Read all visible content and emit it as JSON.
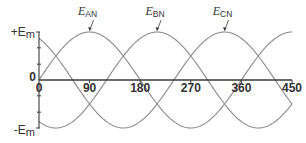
{
  "chart_data": {
    "type": "line",
    "title": "",
    "xlabel": "",
    "ylabel": "",
    "x_unit": "degrees",
    "xlim": [
      0,
      450
    ],
    "ylim": [
      -1,
      1
    ],
    "grid": false,
    "legend": "inline-annotations",
    "x_ticks": [
      0,
      90,
      180,
      270,
      360,
      450
    ],
    "x_tick_labels": [
      "0",
      "90",
      "180",
      "270",
      "360",
      "450"
    ],
    "y_ticks": [
      {
        "value": 1,
        "label_prefix": "+E",
        "label_sub": "m"
      },
      {
        "value": 0,
        "label_prefix": "0",
        "label_sub": ""
      },
      {
        "value": -1,
        "label_prefix": "-E",
        "label_sub": "m"
      }
    ],
    "y_minor_ticks": [
      0.67,
      0.33,
      -0.33,
      -0.67
    ],
    "series": [
      {
        "name": "E_AN",
        "label_main": "E",
        "label_sub": "AN",
        "function": "sin(θ)",
        "phase_deg": 0,
        "peak_at_deg": 90,
        "color": "#8a8a8a",
        "x": [
          0,
          30,
          60,
          90,
          120,
          150,
          180,
          210,
          240,
          270,
          300,
          330,
          360,
          390,
          420,
          450
        ],
        "values": [
          0,
          0.5,
          0.866,
          1,
          0.866,
          0.5,
          0,
          -0.5,
          -0.866,
          -1,
          -0.866,
          -0.5,
          0,
          0.5,
          0.866,
          1
        ]
      },
      {
        "name": "E_BN",
        "label_main": "E",
        "label_sub": "BN",
        "function": "sin(θ-120°)",
        "phase_deg": -120,
        "peak_at_deg": 210,
        "color": "#8a8a8a",
        "x": [
          0,
          30,
          60,
          90,
          120,
          150,
          180,
          210,
          240,
          270,
          300,
          330,
          360,
          390,
          420,
          450
        ],
        "values": [
          -0.866,
          -1,
          -0.866,
          -0.5,
          0,
          0.5,
          0.866,
          1,
          0.866,
          0.5,
          0,
          -0.5,
          -0.866,
          -1,
          -0.866,
          -0.5
        ]
      },
      {
        "name": "E_CN",
        "label_main": "E",
        "label_sub": "CN",
        "function": "sin(θ-240°)",
        "phase_deg": -240,
        "peak_at_deg": 330,
        "color": "#8a8a8a",
        "x": [
          0,
          30,
          60,
          90,
          120,
          150,
          180,
          210,
          240,
          270,
          300,
          330,
          360,
          390,
          420,
          450
        ],
        "values": [
          0.866,
          0.5,
          0,
          -0.5,
          -0.866,
          -1,
          -0.866,
          -0.5,
          0,
          0.5,
          0.866,
          1,
          0.866,
          0.5,
          0,
          -0.5
        ]
      }
    ],
    "annotations": [
      {
        "text": "E_AN",
        "points_to_deg": 90,
        "value": 1
      },
      {
        "text": "E_BN",
        "points_to_deg": 210,
        "value": 1
      },
      {
        "text": "E_CN",
        "points_to_deg": 330,
        "value": 1
      }
    ]
  },
  "colors": {
    "curve": "#8a8a8a",
    "axis": "#3a3a3a",
    "text": "#333333"
  }
}
